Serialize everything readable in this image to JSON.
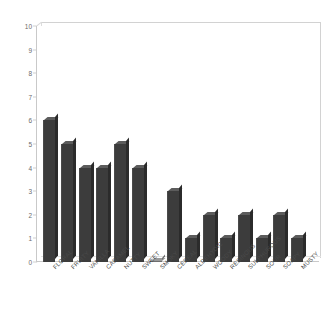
{
  "chart_data": {
    "type": "bar",
    "title": "",
    "xlabel": "",
    "ylabel": "",
    "ylim": [
      0,
      10
    ],
    "grid": false,
    "legend": "none",
    "y_ticks": [
      0,
      1,
      2,
      3,
      4,
      5,
      6,
      7,
      8,
      9,
      10
    ],
    "categories": [
      "FLORAL",
      "FRUITY",
      "VANILLA",
      "CARAMEL",
      "NUTTY",
      "SWEET",
      "SMOKY",
      "CEREAL",
      "ALDEHYDIC",
      "WOODY",
      "RESINOUS",
      "SULPHUROUS",
      "SOUR",
      "SOAPY",
      "MUSTY"
    ],
    "values": [
      6,
      5,
      4,
      4,
      5,
      4,
      0,
      3,
      1,
      2,
      1,
      2,
      1,
      2,
      1
    ],
    "series": [
      {
        "name": "",
        "values": [
          6,
          5,
          4,
          4,
          5,
          4,
          0,
          3,
          1,
          2,
          1,
          2,
          1,
          2,
          1
        ]
      }
    ]
  },
  "style": {
    "bar_color": "#3c3c3c",
    "bar_top_color": "#5c5c5c",
    "bar_side_color": "#2b2b2b",
    "axis_color": "#c9c9c9",
    "tick_text_color": "#6b6b6b",
    "label_text_color": "#4a4a4a",
    "background": "#ffffff"
  }
}
